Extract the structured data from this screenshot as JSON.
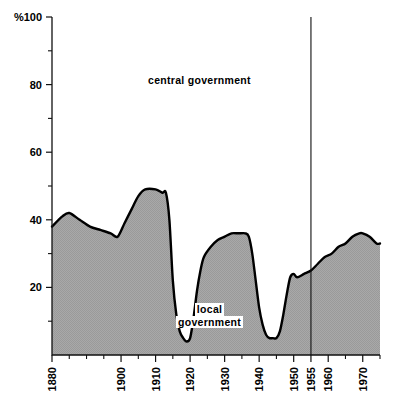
{
  "chart_data": {
    "type": "area",
    "title": "",
    "subtitle": "",
    "xlabel": "",
    "ylabel": "%",
    "xlim": [
      1880,
      1975
    ],
    "ylim": [
      0,
      100
    ],
    "grid": false,
    "legend_position": "inline-annotation",
    "y_axis": {
      "unit_label": "%",
      "major_ticks": [
        100,
        80,
        60,
        40,
        20
      ],
      "major_tick_labels": [
        "100",
        "80",
        "60",
        "40",
        "20"
      ],
      "minor_ticks": [
        90,
        70,
        50,
        30,
        10
      ]
    },
    "x_axis": {
      "labelled_ticks": [
        1880,
        1900,
        1910,
        1920,
        1930,
        1940,
        1950,
        1955,
        1960,
        1970
      ],
      "labelled_tick_text": [
        "1880",
        "1900",
        "1910",
        "1920",
        "1930",
        "1940",
        "1950",
        "1955",
        "1960",
        "1970"
      ],
      "tick_interval_years": 5,
      "tick_years": [
        1880,
        1885,
        1890,
        1895,
        1900,
        1905,
        1910,
        1915,
        1920,
        1925,
        1930,
        1935,
        1940,
        1945,
        1950,
        1955,
        1960,
        1965,
        1970,
        1975
      ]
    },
    "annotations": [
      {
        "text": "central government",
        "region": "upper",
        "x": 1917,
        "y": 83
      },
      {
        "text": "local government",
        "region": "lower-filled",
        "x": 1935,
        "y": 17
      }
    ],
    "vertical_rule": {
      "x": 1955,
      "label": "1955",
      "from_y": 0,
      "to_y": 100
    },
    "series": [
      {
        "name": "local government",
        "fill": "#a8a8a8",
        "stroke": "#000000",
        "values": [
          {
            "year": 1880,
            "value": 38
          },
          {
            "year": 1883,
            "value": 41
          },
          {
            "year": 1885,
            "value": 42
          },
          {
            "year": 1888,
            "value": 40
          },
          {
            "year": 1891,
            "value": 38
          },
          {
            "year": 1894,
            "value": 37
          },
          {
            "year": 1897,
            "value": 36
          },
          {
            "year": 1899,
            "value": 35
          },
          {
            "year": 1901,
            "value": 39
          },
          {
            "year": 1903,
            "value": 43
          },
          {
            "year": 1905,
            "value": 47
          },
          {
            "year": 1907,
            "value": 49
          },
          {
            "year": 1910,
            "value": 49
          },
          {
            "year": 1912,
            "value": 48
          },
          {
            "year": 1913,
            "value": 48
          },
          {
            "year": 1914,
            "value": 40
          },
          {
            "year": 1915,
            "value": 22
          },
          {
            "year": 1916,
            "value": 12
          },
          {
            "year": 1917,
            "value": 7
          },
          {
            "year": 1918,
            "value": 5
          },
          {
            "year": 1919,
            "value": 4
          },
          {
            "year": 1920,
            "value": 5
          },
          {
            "year": 1921,
            "value": 11
          },
          {
            "year": 1922,
            "value": 19
          },
          {
            "year": 1923,
            "value": 25
          },
          {
            "year": 1924,
            "value": 29
          },
          {
            "year": 1926,
            "value": 32
          },
          {
            "year": 1928,
            "value": 34
          },
          {
            "year": 1930,
            "value": 35
          },
          {
            "year": 1932,
            "value": 36
          },
          {
            "year": 1934,
            "value": 36
          },
          {
            "year": 1936,
            "value": 36
          },
          {
            "year": 1937,
            "value": 35
          },
          {
            "year": 1938,
            "value": 30
          },
          {
            "year": 1939,
            "value": 22
          },
          {
            "year": 1940,
            "value": 14
          },
          {
            "year": 1941,
            "value": 9
          },
          {
            "year": 1942,
            "value": 6
          },
          {
            "year": 1943,
            "value": 5
          },
          {
            "year": 1944,
            "value": 5
          },
          {
            "year": 1945,
            "value": 5
          },
          {
            "year": 1946,
            "value": 7
          },
          {
            "year": 1947,
            "value": 12
          },
          {
            "year": 1948,
            "value": 18
          },
          {
            "year": 1949,
            "value": 23
          },
          {
            "year": 1950,
            "value": 24
          },
          {
            "year": 1951,
            "value": 23
          },
          {
            "year": 1953,
            "value": 24
          },
          {
            "year": 1955,
            "value": 25
          },
          {
            "year": 1957,
            "value": 27
          },
          {
            "year": 1959,
            "value": 29
          },
          {
            "year": 1961,
            "value": 30
          },
          {
            "year": 1963,
            "value": 32
          },
          {
            "year": 1965,
            "value": 33
          },
          {
            "year": 1967,
            "value": 35
          },
          {
            "year": 1969,
            "value": 36
          },
          {
            "year": 1970,
            "value": 36
          },
          {
            "year": 1972,
            "value": 35
          },
          {
            "year": 1974,
            "value": 33
          },
          {
            "year": 1975,
            "value": 33
          }
        ]
      },
      {
        "name": "central government",
        "fill": "#ffffff",
        "stroke": "#000000",
        "note": "complement of local government to 100%"
      }
    ]
  },
  "labels": {
    "percent_symbol": "%",
    "central_government": "central government",
    "local_government_line1": "local",
    "local_government_line2": "government"
  },
  "colors": {
    "fill": "#a8a8a8",
    "line": "#000000",
    "background": "#ffffff",
    "axis": "#111111"
  }
}
